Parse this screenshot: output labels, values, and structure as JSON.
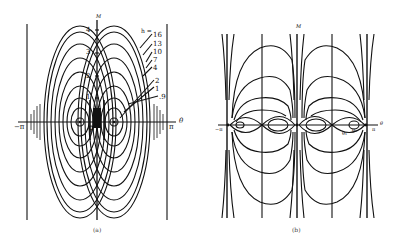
{
  "figure": {
    "panels": [
      {
        "id": "a",
        "caption": "(a)",
        "axis_labels": {
          "vertical": "M",
          "horizontal": "θ"
        },
        "x_ticks": {
          "left": "−π",
          "origin": "0",
          "right": "π"
        },
        "y_ticks": [
          "1",
          "2",
          "3",
          "4"
        ],
        "contour_label_header": "h =",
        "contour_levels": [
          "16",
          "13",
          "10",
          "7",
          "4",
          "2",
          "1",
          ".9"
        ]
      },
      {
        "id": "b",
        "caption": "(b)",
        "axis_labels": {
          "vertical": "M",
          "horizontal": "θ"
        },
        "x_ticks": {
          "left": "−π",
          "right": "π"
        },
        "point_labels": [
          "θ₁",
          "θ₂"
        ]
      }
    ]
  },
  "colors": {
    "ink": "#111111",
    "background": "#ffffff"
  }
}
